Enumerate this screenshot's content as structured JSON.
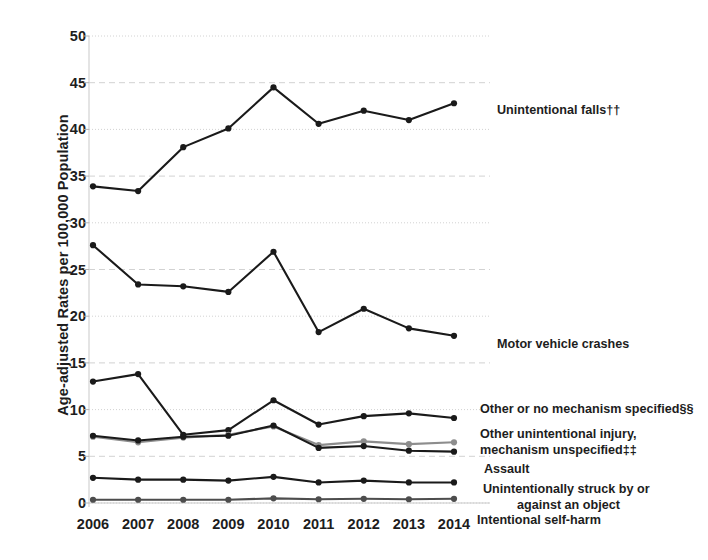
{
  "chart_data": {
    "type": "line",
    "title": "",
    "xlabel": "",
    "ylabel": "Age-adjusted Rates per 100,000 Population",
    "categories": [
      "2006",
      "2007",
      "2008",
      "2009",
      "2010",
      "2011",
      "2012",
      "2013",
      "2014"
    ],
    "x": [
      2006,
      2007,
      2008,
      2009,
      2010,
      2011,
      2012,
      2013,
      2014
    ],
    "ylim": [
      0,
      50
    ],
    "yticks": [
      0,
      5,
      10,
      15,
      20,
      25,
      30,
      35,
      40,
      45,
      50
    ],
    "grid": true,
    "legend_position": "right-inline-end-of-line",
    "series": [
      {
        "name": "Unintentional falls††",
        "color": "#1a1a1a",
        "values": [
          33.9,
          33.4,
          38.1,
          40.1,
          44.5,
          40.6,
          42.0,
          41.0,
          42.8
        ]
      },
      {
        "name": "Motor vehicle crashes",
        "color": "#1a1a1a",
        "values": [
          27.6,
          23.4,
          23.2,
          22.6,
          26.9,
          18.3,
          20.8,
          18.7,
          17.9
        ]
      },
      {
        "name": "Other or no mechanism specified§§",
        "color": "#1a1a1a",
        "values": [
          13.0,
          13.8,
          7.3,
          7.8,
          11.0,
          8.4,
          9.3,
          9.6,
          9.1
        ]
      },
      {
        "name": "Other unintentional injury, mechanism unspecified‡‡",
        "color": "#8d8d8d",
        "values": [
          7.1,
          6.5,
          7.0,
          7.3,
          8.2,
          6.2,
          6.6,
          6.3,
          6.5
        ]
      },
      {
        "name": "Assault",
        "color": "#1a1a1a",
        "values": [
          7.2,
          6.7,
          7.1,
          7.2,
          8.3,
          5.9,
          6.1,
          5.6,
          5.5
        ]
      },
      {
        "name": "Unintentionally struck by or against an object",
        "color": "#1a1a1a",
        "values": [
          2.7,
          2.5,
          2.5,
          2.4,
          2.8,
          2.2,
          2.4,
          2.2,
          2.2
        ]
      },
      {
        "name": "Intentional self-harm",
        "color": "#4d4d4d",
        "values": [
          0.35,
          0.35,
          0.35,
          0.35,
          0.5,
          0.4,
          0.45,
          0.4,
          0.45
        ]
      }
    ],
    "series_labels": [
      {
        "text": "Unintentional falls††",
        "x": 497,
        "y": 103
      },
      {
        "text": "Motor vehicle crashes",
        "x": 497,
        "y": 337
      },
      {
        "text": "Other or no mechanism specified§§",
        "x": 480,
        "y": 402
      },
      {
        "text": "Other unintentional injury,",
        "x": 480,
        "y": 427
      },
      {
        "text": "mechanism unspecified‡‡",
        "x": 480,
        "y": 443
      },
      {
        "text": "Assault",
        "x": 484,
        "y": 462
      },
      {
        "text": "Unintentionally struck by or",
        "x": 483,
        "y": 482
      },
      {
        "text": "against an object",
        "x": 517,
        "y": 498
      },
      {
        "text": "Intentional self-harm",
        "x": 477,
        "y": 513
      }
    ]
  }
}
